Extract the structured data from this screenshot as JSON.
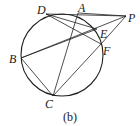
{
  "figure": {
    "caption": "(b)",
    "circle": {
      "cx": 62,
      "cy": 55,
      "r": 41
    },
    "points": {
      "D": {
        "label": "D",
        "x": 46,
        "y": 14,
        "lx": 37,
        "ly": 14
      },
      "A": {
        "label": "A",
        "x": 78,
        "y": 13,
        "lx": 78,
        "ly": 12
      },
      "P": {
        "label": "P",
        "x": 126,
        "y": 16,
        "lx": 128,
        "ly": 22
      },
      "E": {
        "label": "E",
        "x": 97,
        "y": 29,
        "lx": 100,
        "ly": 38
      },
      "F": {
        "label": "F",
        "x": 101,
        "y": 44,
        "lx": 103,
        "ly": 55
      },
      "B": {
        "label": "B",
        "x": 21,
        "y": 58,
        "lx": 9,
        "ly": 63
      },
      "C": {
        "label": "C",
        "x": 53,
        "y": 96,
        "lx": 45,
        "ly": 108
      }
    },
    "segments": [
      [
        "D",
        "P"
      ],
      [
        "D",
        "E"
      ],
      [
        "D",
        "F"
      ],
      [
        "A",
        "P"
      ],
      [
        "A",
        "C"
      ],
      [
        "B",
        "P"
      ],
      [
        "B",
        "E"
      ],
      [
        "B",
        "C"
      ],
      [
        "C",
        "F"
      ],
      [
        "F",
        "P"
      ]
    ]
  }
}
